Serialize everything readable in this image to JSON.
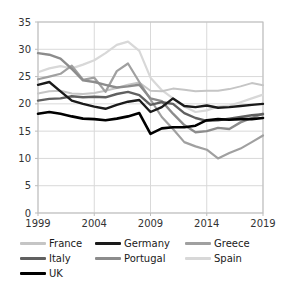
{
  "chart_data": {
    "type": "line",
    "title": "",
    "xlabel": "",
    "ylabel": "",
    "x": [
      1999,
      2000,
      2001,
      2002,
      2003,
      2004,
      2005,
      2006,
      2007,
      2008,
      2009,
      2010,
      2011,
      2012,
      2013,
      2014,
      2015,
      2016,
      2017,
      2018,
      2019
    ],
    "series": [
      {
        "name": "France",
        "color": "#c5c5c5",
        "width": 2,
        "values": [
          21.9,
          22.3,
          22.4,
          21.9,
          21.8,
          22.0,
          22.4,
          22.9,
          23.5,
          23.9,
          22.4,
          22.3,
          22.8,
          22.6,
          22.3,
          22.4,
          22.4,
          22.7,
          23.2,
          23.8,
          23.4
        ]
      },
      {
        "name": "Germany",
        "color": "#1a1a1a",
        "width": 2.4,
        "values": [
          23.5,
          24.0,
          22.3,
          20.6,
          20.0,
          19.5,
          19.1,
          19.8,
          20.4,
          20.7,
          18.5,
          19.4,
          21.0,
          19.6,
          19.4,
          19.7,
          19.3,
          19.4,
          19.6,
          19.8,
          20.0
        ]
      },
      {
        "name": "Greece",
        "color": "#a0a0a0",
        "width": 2.2,
        "values": [
          24.5,
          25.0,
          25.5,
          27.0,
          24.4,
          24.8,
          22.2,
          26.0,
          27.4,
          24.0,
          20.8,
          17.6,
          15.4,
          13.0,
          12.2,
          11.6,
          10.0,
          11.0,
          11.8,
          13.0,
          14.2
        ]
      },
      {
        "name": "Italy",
        "color": "#606060",
        "width": 2.4,
        "values": [
          20.6,
          20.9,
          21.0,
          21.4,
          21.2,
          21.3,
          21.2,
          21.8,
          22.2,
          21.6,
          19.8,
          20.3,
          20.0,
          18.3,
          17.4,
          16.9,
          17.0,
          17.3,
          17.6,
          17.9,
          18.1
        ]
      },
      {
        "name": "Portugal",
        "color": "#8c8c8c",
        "width": 2.4,
        "values": [
          29.3,
          29.0,
          28.3,
          26.4,
          24.3,
          24.0,
          23.5,
          23.0,
          23.2,
          23.5,
          21.0,
          20.5,
          18.2,
          16.1,
          14.8,
          15.0,
          15.6,
          15.4,
          16.6,
          17.4,
          18.2
        ]
      },
      {
        "name": "Spain",
        "color": "#d8d8d8",
        "width": 2.2,
        "values": [
          25.8,
          26.5,
          26.9,
          26.5,
          27.2,
          28.0,
          29.3,
          30.8,
          31.4,
          29.7,
          24.8,
          22.5,
          21.0,
          19.5,
          18.5,
          18.8,
          19.5,
          19.7,
          20.3,
          21.0,
          21.7
        ]
      },
      {
        "name": "UK",
        "color": "#000000",
        "width": 2.6,
        "values": [
          18.2,
          18.5,
          18.2,
          17.7,
          17.3,
          17.2,
          17.0,
          17.3,
          17.7,
          18.3,
          14.5,
          15.5,
          15.7,
          15.7,
          16.0,
          17.0,
          17.2,
          17.1,
          17.2,
          17.2,
          17.4
        ]
      }
    ],
    "ylim": [
      0,
      35
    ],
    "yticks": [
      0,
      5,
      10,
      15,
      20,
      25,
      30,
      35
    ],
    "xticks": [
      1999,
      2004,
      2009,
      2014,
      2019
    ],
    "grid": true,
    "legend_position": "bottom",
    "legend_order": [
      "France",
      "Germany",
      "Greece",
      "Italy",
      "Portugal",
      "Spain",
      "UK"
    ],
    "draw_order": [
      "Spain",
      "France",
      "Greece",
      "Portugal",
      "Italy",
      "Germany",
      "UK"
    ]
  },
  "colors": {
    "background": "#ffffff",
    "grid": "#d9d9d9",
    "axis_border": "#bdbdbd",
    "tick_label": "#333333",
    "legend_text": "#1a1a1a"
  }
}
